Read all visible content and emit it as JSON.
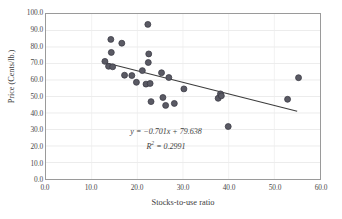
{
  "chart_data": {
    "type": "scatter",
    "title": "",
    "xlabel": "Stocks-to-use ratio",
    "ylabel": "Price (Cents/lb.)",
    "xlim": [
      0.0,
      60.0
    ],
    "ylim": [
      0.0,
      100.0
    ],
    "xticks": [
      "0.0",
      "10.0",
      "20.0",
      "30.0",
      "40.0",
      "50.0",
      "60.0"
    ],
    "yticks": [
      "0.0",
      "10.0",
      "20.0",
      "30.0",
      "40.0",
      "50.0",
      "60.0",
      "70.0",
      "80.0",
      "90.0",
      "100.0"
    ],
    "xtick_values": [
      0,
      10,
      20,
      30,
      40,
      50,
      60
    ],
    "ytick_values": [
      0,
      10,
      20,
      30,
      40,
      50,
      60,
      70,
      80,
      90,
      100
    ],
    "grid": "horizontal-and-vertical-light",
    "legend": "none",
    "marker_color": "#5a5a64",
    "marker_edge_color": "#3c3c46",
    "trendline_color": "#3c3c3c",
    "points": [
      {
        "x": 12.9,
        "y": 71.3
      },
      {
        "x": 13.7,
        "y": 68.3
      },
      {
        "x": 14.2,
        "y": 84.6
      },
      {
        "x": 14.3,
        "y": 76.7
      },
      {
        "x": 14.6,
        "y": 68.0
      },
      {
        "x": 16.6,
        "y": 82.3
      },
      {
        "x": 17.2,
        "y": 62.9
      },
      {
        "x": 18.8,
        "y": 62.7
      },
      {
        "x": 19.8,
        "y": 58.6
      },
      {
        "x": 21.1,
        "y": 65.7
      },
      {
        "x": 21.9,
        "y": 57.5
      },
      {
        "x": 22.3,
        "y": 93.7
      },
      {
        "x": 22.4,
        "y": 70.6
      },
      {
        "x": 22.5,
        "y": 75.8
      },
      {
        "x": 22.8,
        "y": 57.9
      },
      {
        "x": 23.0,
        "y": 46.9
      },
      {
        "x": 25.3,
        "y": 64.4
      },
      {
        "x": 25.6,
        "y": 49.4
      },
      {
        "x": 26.2,
        "y": 44.6
      },
      {
        "x": 26.9,
        "y": 61.5
      },
      {
        "x": 28.1,
        "y": 45.8
      },
      {
        "x": 30.2,
        "y": 54.6
      },
      {
        "x": 37.7,
        "y": 48.9
      },
      {
        "x": 38.2,
        "y": 51.6
      },
      {
        "x": 38.4,
        "y": 50.4
      },
      {
        "x": 39.9,
        "y": 31.8
      },
      {
        "x": 52.9,
        "y": 48.3
      },
      {
        "x": 55.3,
        "y": 61.4
      }
    ],
    "trendline": {
      "slope": -0.701,
      "intercept": 79.638,
      "x_start": 12.6,
      "x_end": 55.0,
      "equation_text": "y = −0.701x + 79.638",
      "r2_label": "R",
      "r2_exponent": "2",
      "r2_value": "= 0.2991"
    }
  }
}
